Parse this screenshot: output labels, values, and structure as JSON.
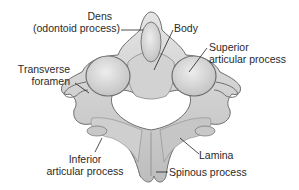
{
  "diagram": {
    "colors": {
      "background": "#ffffff",
      "bone_fill": "#dcdcdc",
      "bone_shade": "#b8b8b8",
      "bone_outline": "#6e6e6e",
      "leader_line": "#222222",
      "text": "#2a2a2a"
    },
    "labels": {
      "dens": {
        "line1": "Dens",
        "line2": "(odontoid process)"
      },
      "body": {
        "line1": "Body"
      },
      "superior_articular": {
        "line1": "Superior",
        "line2": "articular process"
      },
      "transverse_foramen": {
        "line1": "Transverse",
        "line2": "foramen"
      },
      "inferior_articular": {
        "line1": "Inferior",
        "line2": "articular process"
      },
      "lamina": {
        "line1": "Lamina"
      },
      "spinous_process": {
        "line1": "Spinous process"
      }
    }
  }
}
